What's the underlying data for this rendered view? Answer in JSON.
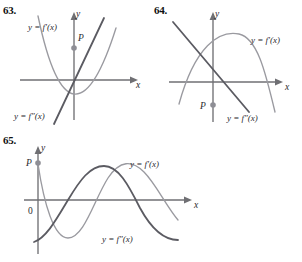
{
  "page": {
    "kind": "textbook-exercise-figures",
    "background": "#ffffff",
    "curve_color_light": "#9a9aa0",
    "curve_color_dark": "#5b5b62",
    "axis_color": "#6f6f73",
    "point_color": "#8e8e95"
  },
  "panels": [
    {
      "number": "63.",
      "y_axis_label": "y",
      "x_axis_label": "x",
      "origin_label": "",
      "point_label": "P",
      "curve_labels": {
        "upper": "y = f′(x)",
        "lower": "y = f″(x)"
      }
    },
    {
      "number": "64.",
      "y_axis_label": "y",
      "x_axis_label": "x",
      "origin_label": "",
      "point_label": "P",
      "curve_labels": {
        "upper": "y = f′(x)",
        "lower": "y = f″(x)"
      }
    },
    {
      "number": "65.",
      "y_axis_label": "y",
      "x_axis_label": "x",
      "origin_label": "0",
      "point_label": "P",
      "curve_labels": {
        "upper": "y = f′(x)",
        "lower": "y = f″(x)"
      }
    }
  ]
}
